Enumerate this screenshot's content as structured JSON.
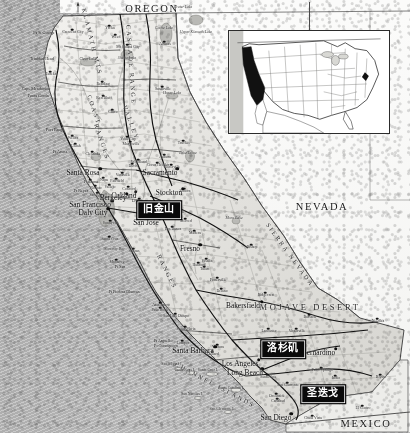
{
  "map": {
    "title": "California Reference Map",
    "subject_state": "California",
    "projection_note": "shaded relief, grayscale",
    "frame": {
      "width": 410,
      "height": 433
    },
    "colors": {
      "ocean": "#b4b4b4",
      "land": "#e8e8e6",
      "land_dark": "#cfcfcb",
      "border": "#2c2c2c",
      "callout_bg": "#0a0a0a",
      "callout_text": "#ffffff",
      "label_text": "#101010",
      "highlight_state": "#0d0d0d"
    }
  },
  "compass": {
    "icon": "north-arrow-icon",
    "label": "N"
  },
  "neighbor_labels": [
    {
      "name": "OREGON",
      "text": "OREGON",
      "x": 152,
      "y": 9,
      "cls": "state"
    },
    {
      "name": "NEVADA",
      "text": "NEVADA",
      "x": 322,
      "y": 207,
      "cls": "state"
    },
    {
      "name": "MEXICO",
      "text": "MEXICO",
      "x": 366,
      "y": 424,
      "cls": "state"
    },
    {
      "name": "MOJAVE-DESERT",
      "text": "MOJAVE DESERT",
      "x": 310,
      "y": 307,
      "cls": "region"
    }
  ],
  "callouts": [
    {
      "name": "callout-san-francisco",
      "text": "旧金山",
      "x": 159,
      "y": 210,
      "for": "San Francisco"
    },
    {
      "name": "callout-los-angeles",
      "text": "洛杉矶",
      "x": 283,
      "y": 349,
      "for": "Los Angeles"
    },
    {
      "name": "callout-san-diego",
      "text": "圣迭戈",
      "x": 323,
      "y": 394,
      "for": "San Diego"
    }
  ],
  "major_cities": [
    {
      "name": "San Francisco",
      "text": "San Francisco",
      "x": 90,
      "y": 205,
      "dx": 0,
      "dy": 0
    },
    {
      "name": "Los Angeles",
      "text": "Los Angeles",
      "x": 240,
      "y": 364,
      "dx": 0,
      "dy": 0
    },
    {
      "name": "San Diego",
      "text": "San Diego",
      "x": 276,
      "y": 418,
      "dx": 0,
      "dy": 0
    },
    {
      "name": "San Jose",
      "text": "San Jose",
      "x": 146,
      "y": 223,
      "dx": 0,
      "dy": 0
    },
    {
      "name": "Sacramento",
      "text": "Sacramento",
      "x": 160,
      "y": 173,
      "dx": 0,
      "dy": 0
    },
    {
      "name": "Long Beach",
      "text": "Long Beach",
      "x": 245,
      "y": 373,
      "dx": 0,
      "dy": 0
    },
    {
      "name": "Daly City",
      "text": "Daly City",
      "x": 93,
      "y": 213,
      "dx": 0,
      "dy": 0
    },
    {
      "name": "Fresno",
      "text": "Fresno",
      "x": 190,
      "y": 249,
      "dx": 0,
      "dy": 0
    },
    {
      "name": "Bakersfield",
      "text": "Bakersfield",
      "x": 243,
      "y": 306,
      "dx": 0,
      "dy": 0
    },
    {
      "name": "Santa Rosa",
      "text": "Santa Rosa",
      "x": 83,
      "y": 173,
      "dx": 0,
      "dy": 0
    },
    {
      "name": "Stockton",
      "text": "Stockton",
      "x": 169,
      "y": 193,
      "dx": 0,
      "dy": 0
    },
    {
      "name": "Oakland",
      "text": "Oakland",
      "x": 124,
      "y": 196,
      "dx": 0,
      "dy": 0
    },
    {
      "name": "Berkeley",
      "text": "Berkeley",
      "x": 113,
      "y": 198,
      "dx": 0,
      "dy": 0
    },
    {
      "name": "Santa Barbara",
      "text": "Santa Barbara",
      "x": 193,
      "y": 351,
      "dx": 0,
      "dy": 0
    },
    {
      "name": "San Bernardino",
      "text": "San Bernardino",
      "x": 312,
      "y": 353,
      "dx": 0,
      "dy": 0
    }
  ],
  "cities": [
    {
      "name": "Eureka",
      "text": "Eureka",
      "x": 51,
      "y": 75
    },
    {
      "name": "Crescent City",
      "text": "Crescent City",
      "x": 73,
      "y": 33
    },
    {
      "name": "Redding",
      "text": "Redding",
      "x": 103,
      "y": 85
    },
    {
      "name": "Red Bluff",
      "text": "Red Bluff",
      "x": 104,
      "y": 99
    },
    {
      "name": "Chico",
      "text": "Chico",
      "x": 113,
      "y": 113
    },
    {
      "name": "Yuba City",
      "text": "Yuba City",
      "x": 128,
      "y": 140
    },
    {
      "name": "Marysville",
      "text": "Marysville",
      "x": 131,
      "y": 145
    },
    {
      "name": "Susanville",
      "text": "Susanville",
      "x": 163,
      "y": 90
    },
    {
      "name": "Alturas",
      "text": "Alturas",
      "x": 165,
      "y": 45
    },
    {
      "name": "Weed",
      "text": "Weed",
      "x": 116,
      "y": 38
    },
    {
      "name": "Mt Shasta City",
      "text": "Mt Shasta City",
      "x": 128,
      "y": 48
    },
    {
      "name": "Yreka",
      "text": "Yreka",
      "x": 110,
      "y": 29
    },
    {
      "name": "Woodland",
      "text": "Woodland",
      "x": 139,
      "y": 163
    },
    {
      "name": "Davis",
      "text": "Davis",
      "x": 133,
      "y": 167
    },
    {
      "name": "Fairfield",
      "text": "Fairfield",
      "x": 117,
      "y": 182
    },
    {
      "name": "Vacaville",
      "text": "Vacaville",
      "x": 123,
      "y": 176
    },
    {
      "name": "Napa",
      "text": "Napa",
      "x": 104,
      "y": 181
    },
    {
      "name": "Citrus Heights",
      "text": "Citrus Heights",
      "x": 158,
      "y": 166
    },
    {
      "name": "Vallejo",
      "text": "Vallejo",
      "x": 110,
      "y": 188
    },
    {
      "name": "Concord",
      "text": "Concord",
      "x": 129,
      "y": 190
    },
    {
      "name": "Livermore",
      "text": "Livermore",
      "x": 140,
      "y": 202
    },
    {
      "name": "Modesto",
      "text": "Modesto",
      "x": 175,
      "y": 206
    },
    {
      "name": "Merced",
      "text": "Merced",
      "x": 186,
      "y": 222
    },
    {
      "name": "Turlock",
      "text": "Turlock",
      "x": 178,
      "y": 213
    },
    {
      "name": "Los Banos",
      "text": "Los Banos",
      "x": 173,
      "y": 230
    },
    {
      "name": "Madera",
      "text": "Madera",
      "x": 195,
      "y": 234
    },
    {
      "name": "Sunnyvale",
      "text": "Sunnyvale",
      "x": 111,
      "y": 224
    },
    {
      "name": "Santa Cruz",
      "text": "Santa Cruz",
      "x": 110,
      "y": 240
    },
    {
      "name": "Monterey",
      "text": "Monterey",
      "x": 117,
      "y": 263
    },
    {
      "name": "Salinas",
      "text": "Salinas",
      "x": 134,
      "y": 252
    },
    {
      "name": "Hanford",
      "text": "Hanford",
      "x": 199,
      "y": 266
    },
    {
      "name": "Visalia",
      "text": "Visalia",
      "x": 207,
      "y": 262
    },
    {
      "name": "Porterville",
      "text": "Porterville",
      "x": 218,
      "y": 281
    },
    {
      "name": "Delano",
      "text": "Delano",
      "x": 222,
      "y": 292
    },
    {
      "name": "Tulare",
      "text": "Tulare",
      "x": 205,
      "y": 270
    },
    {
      "name": "Atascadero",
      "text": "Atascadero",
      "x": 161,
      "y": 306
    },
    {
      "name": "Paso Robles",
      "text": "Paso Robles",
      "x": 161,
      "y": 311
    },
    {
      "name": "San Luis Obispo",
      "text": "San Luis Obispo",
      "x": 176,
      "y": 317
    },
    {
      "name": "Santa Maria",
      "text": "Santa Maria",
      "x": 186,
      "y": 330
    },
    {
      "name": "Lompoc",
      "text": "Lompoc",
      "x": 183,
      "y": 344
    },
    {
      "name": "Ventura",
      "text": "Ventura",
      "x": 218,
      "y": 348
    },
    {
      "name": "Oxnard",
      "text": "Oxnard",
      "x": 213,
      "y": 355
    },
    {
      "name": "Lancaster",
      "text": "Lancaster",
      "x": 269,
      "y": 332
    },
    {
      "name": "Victorville",
      "text": "Victorville",
      "x": 297,
      "y": 332
    },
    {
      "name": "Santa Ana",
      "text": "Santa Ana",
      "x": 268,
      "y": 378
    },
    {
      "name": "San Clemente",
      "text": "San Clemente",
      "x": 288,
      "y": 386
    },
    {
      "name": "Oceanside",
      "text": "Oceanside",
      "x": 277,
      "y": 397
    },
    {
      "name": "Carlsbad",
      "text": "Carlsbad",
      "x": 278,
      "y": 402
    },
    {
      "name": "Chula Vista",
      "text": "Chula Vista",
      "x": 313,
      "y": 419
    },
    {
      "name": "Palm Springs",
      "text": "Palm Springs",
      "x": 322,
      "y": 371
    },
    {
      "name": "Indio",
      "text": "Indio",
      "x": 336,
      "y": 379
    },
    {
      "name": "El Centro",
      "text": "El Centro",
      "x": 363,
      "y": 409
    },
    {
      "name": "Barstow",
      "text": "Barstow",
      "x": 310,
      "y": 318
    },
    {
      "name": "Needles",
      "text": "Needles",
      "x": 378,
      "y": 322
    },
    {
      "name": "Blythe",
      "text": "Blythe",
      "x": 381,
      "y": 378
    },
    {
      "name": "Ridgecrest",
      "text": "Ridgecrest",
      "x": 266,
      "y": 296
    },
    {
      "name": "Bishop",
      "text": "Bishop",
      "x": 252,
      "y": 248
    },
    {
      "name": "Ukiah",
      "text": "Ukiah",
      "x": 76,
      "y": 147
    },
    {
      "name": "Willits",
      "text": "Willits",
      "x": 73,
      "y": 139
    },
    {
      "name": "Clearlake",
      "text": "Clearlake",
      "x": 93,
      "y": 155
    },
    {
      "name": "Petaluma",
      "text": "Petaluma",
      "x": 91,
      "y": 183
    },
    {
      "name": "Novato",
      "text": "Novato",
      "x": 96,
      "y": 189
    },
    {
      "name": "San Rafael",
      "text": "San Rafael",
      "x": 98,
      "y": 196
    },
    {
      "name": "Auburn",
      "text": "Auburn",
      "x": 165,
      "y": 158
    },
    {
      "name": "Placerville",
      "text": "Placerville",
      "x": 172,
      "y": 168
    },
    {
      "name": "Truckee",
      "text": "Truckee",
      "x": 184,
      "y": 144
    },
    {
      "name": "Sonora",
      "text": "Sonora",
      "x": 185,
      "y": 192
    }
  ],
  "coastal_features": [
    {
      "name": "Pt St George",
      "text": "Pt St George",
      "x": 44,
      "y": 33
    },
    {
      "name": "Trinidad Head",
      "text": "Trinidad Head",
      "x": 42,
      "y": 59
    },
    {
      "name": "Cape Mendocino",
      "text": "Cape Mendocino",
      "x": 36,
      "y": 89
    },
    {
      "name": "Punta Gorda",
      "text": "Punta Gorda",
      "x": 38,
      "y": 96
    },
    {
      "name": "Fort Bragg",
      "text": "Fort Bragg",
      "x": 55,
      "y": 130
    },
    {
      "name": "Pt Arena",
      "text": "Pt Arena",
      "x": 60,
      "y": 152
    },
    {
      "name": "Pt Reyes",
      "text": "Pt Reyes",
      "x": 81,
      "y": 191
    },
    {
      "name": "Pt Sur",
      "text": "Pt Sur",
      "x": 120,
      "y": 267
    },
    {
      "name": "Pt Piedras Blancas",
      "text": "Pt Piedras Blancas",
      "x": 124,
      "y": 292
    },
    {
      "name": "Pt Arguello",
      "text": "Pt Arguello",
      "x": 163,
      "y": 341
    },
    {
      "name": "Pt Conception",
      "text": "Pt Conception",
      "x": 166,
      "y": 346
    }
  ],
  "water_features": [
    {
      "name": "Crater Lake",
      "text": "Crater Lake",
      "x": 183,
      "y": 8
    },
    {
      "name": "Upper Klamath Lake",
      "text": "Upper Klamath Lake",
      "x": 196,
      "y": 33
    },
    {
      "name": "Clear Lake",
      "text": "Clear Lake",
      "x": 88,
      "y": 60
    },
    {
      "name": "Goose Lake",
      "text": "Goose Lake",
      "x": 164,
      "y": 29
    },
    {
      "name": "Honey Lake",
      "text": "Honey Lake",
      "x": 172,
      "y": 94
    },
    {
      "name": "Lake Tahoe",
      "text": "Lake Tahoe",
      "x": 188,
      "y": 154
    },
    {
      "name": "Mono Lake",
      "text": "Mono Lake",
      "x": 234,
      "y": 219
    },
    {
      "name": "Shasta Lake",
      "text": "Shasta Lake",
      "x": 127,
      "y": 59
    },
    {
      "name": "Salton Sea",
      "text": "Salton Sea",
      "x": 338,
      "y": 394
    },
    {
      "name": "Monterey Bay",
      "text": "Monterey Bay",
      "x": 114,
      "y": 250
    }
  ],
  "mountain_ranges": [
    {
      "name": "COAST RANGES (north)",
      "text": "COAST",
      "x": 94,
      "y": 110,
      "rot": "rot-coast"
    },
    {
      "name": "COAST RANGES label",
      "text": "RANGES",
      "x": 102,
      "y": 142,
      "rot": "rot-coast"
    },
    {
      "name": "KLAMATH MTS",
      "text": "KLAMATH MTS",
      "x": 92,
      "y": 42,
      "rot": "rot-klamath"
    },
    {
      "name": "CASCADE RANGE",
      "text": "CASCADE RANGE",
      "x": 131,
      "y": 65,
      "rot": "rot-cascade"
    },
    {
      "name": "CENTRAL VALLEY",
      "text": "VALLEY",
      "x": 131,
      "y": 123,
      "rot": "rot-valley"
    },
    {
      "name": "COAST RANGES (south)",
      "text": "RANGES",
      "x": 167,
      "y": 272,
      "rot": "rot-ranges"
    },
    {
      "name": "SIERRA NEVADA",
      "text": "SIERRA NEVADA",
      "x": 290,
      "y": 255,
      "rot": "rot-sierra"
    },
    {
      "name": "CHANNEL ISLANDS",
      "text": "CHANNEL ISLANDS",
      "x": 215,
      "y": 385,
      "rot": "rot-channel"
    }
  ],
  "islands": [
    {
      "name": "Santa Cruz I.",
      "text": "Santa Cruz I.",
      "x": 208,
      "y": 371
    },
    {
      "name": "San Miguel I.",
      "text": "San Miguel I.",
      "x": 172,
      "y": 365
    },
    {
      "name": "Santa Rosa I.",
      "text": "Santa Rosa I.",
      "x": 185,
      "y": 371
    },
    {
      "name": "Santa Catalina I.",
      "text": "Santa Catalina I.",
      "x": 231,
      "y": 389
    },
    {
      "name": "San Nicolas I.",
      "text": "San Nicolas I.",
      "x": 192,
      "y": 395
    },
    {
      "name": "San Clemente I.",
      "text": "San Clemente I.",
      "x": 222,
      "y": 410
    }
  ],
  "inset": {
    "name": "usa-locator-inset",
    "description": "United States locator map with California shaded black",
    "highlighted_state": "California",
    "bounds": {
      "x": 228,
      "y": 30,
      "w": 162,
      "h": 104
    }
  }
}
